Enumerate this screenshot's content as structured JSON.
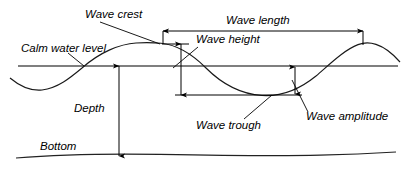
{
  "diagram": {
    "background_color": "#ffffff",
    "line_color": "#000000",
    "curve_color": "#1a1a1a",
    "calm_level_color": "#555555",
    "labels": {
      "wave_crest": "Wave crest",
      "calm_water_level": "Calm water level",
      "wave_length": "Wave length",
      "wave_height": "Wave height",
      "wave_amplitude": "Wave amplitude",
      "wave_trough": "Wave trough",
      "depth": "Depth",
      "bottom": "Bottom"
    },
    "geometry": {
      "calm_water_level_y": 66,
      "crest_y": 43,
      "trough_y": 95,
      "bottom_y": 155,
      "crest1_x": 161,
      "crest2_x": 363,
      "trough_x": 262,
      "wave_length_px": 202,
      "wave_height_px": 52,
      "wave_amplitude_px": 28,
      "depth_px": 89
    }
  }
}
